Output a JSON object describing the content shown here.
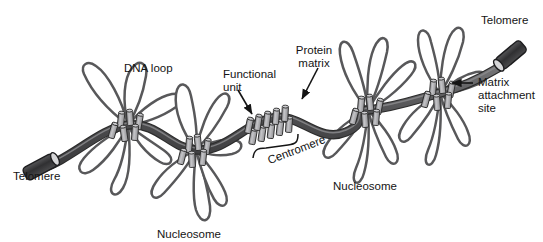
{
  "figure": {
    "background_color": "#ffffff"
  },
  "palette": {
    "strand_fill": "#58585a",
    "strand_stroke": "#2b2b2b",
    "loop_stroke": "#58585a",
    "loop_fill": "#ffffff",
    "cylinder_fill": "#a9a9ac",
    "cylinder_top": "#c9c9cc",
    "cylinder_stroke": "#2b2b2b",
    "telomere_fill": "#3a3a3c",
    "telomere_cap": "#d6d6d8",
    "text_color": "#141414",
    "arrow_color": "#141414"
  },
  "labels": [
    {
      "id": "telomere-left",
      "name": "Telomere",
      "text": "Telomere",
      "lines": [
        "Telomere"
      ],
      "x": 13,
      "y": 170,
      "align": "left",
      "leader": "none",
      "rotation": 0
    },
    {
      "id": "dna-loop",
      "name": "DNA loop",
      "text": "DNA loop",
      "lines": [
        "DNA loop"
      ],
      "x": 124,
      "y": 62,
      "align": "left",
      "leader": "none",
      "rotation": 0
    },
    {
      "id": "functional-unit",
      "name": "Functional unit",
      "text": "Functional unit",
      "lines": [
        "Functional",
        "unit"
      ],
      "x": 223,
      "y": 68,
      "align": "left",
      "leader": "arrow",
      "rotation": 0
    },
    {
      "id": "protein-matrix",
      "name": "Protein matrix",
      "text": "Protein matrix",
      "lines": [
        "Protein",
        "matrix"
      ],
      "x": 281,
      "y": 44,
      "align": "center",
      "leader": "arrow",
      "rotation": 0
    },
    {
      "id": "centromere",
      "name": "Centromere",
      "text": "Centromere",
      "lines": [
        "Centromere"
      ],
      "x": 266,
      "y": 155,
      "align": "left",
      "leader": "bracket",
      "rotation": -21
    },
    {
      "id": "nucleosome-lower",
      "name": "Nucleosome",
      "text": "Nucleosome",
      "lines": [
        "Nucleosome"
      ],
      "x": 157,
      "y": 228,
      "align": "left",
      "leader": "none",
      "rotation": 0
    },
    {
      "id": "nucleosome-right",
      "name": "Nucleosome",
      "text": "Nucleosome",
      "lines": [
        "Nucleosome"
      ],
      "x": 333,
      "y": 180,
      "align": "left",
      "leader": "none",
      "rotation": 0
    },
    {
      "id": "matrix-attachment-site",
      "name": "Matrix attachment site",
      "text": "Matrix attachment site",
      "lines": [
        "Matrix",
        "attachment",
        "site"
      ],
      "x": 478,
      "y": 76,
      "align": "left",
      "leader": "arrow",
      "rotation": 0
    },
    {
      "id": "telomere-right",
      "name": "Telomere",
      "text": "Telomere",
      "lines": [
        "Telomere"
      ],
      "x": 481,
      "y": 14,
      "align": "left",
      "leader": "none",
      "rotation": 0
    }
  ],
  "structures": {
    "scaffold": {
      "name": "protein-matrix-scaffold",
      "description": "wavy dark gray band running left to right"
    },
    "telomeres": [
      {
        "name": "telomere-cap-left",
        "position": "lower-left-end-of-scaffold"
      },
      {
        "name": "telomere-cap-right",
        "position": "upper-right-end-of-scaffold"
      }
    ],
    "rosettes": [
      {
        "name": "loop-rosette-1",
        "loop_count": 6,
        "nucleosome_cluster": true
      },
      {
        "name": "loop-rosette-2",
        "loop_count": 6,
        "nucleosome_cluster": true
      },
      {
        "name": "loop-rosette-3",
        "loop_count": 6,
        "nucleosome_cluster": true
      },
      {
        "name": "loop-rosette-4",
        "loop_count": 6,
        "nucleosome_cluster": true
      }
    ],
    "centromere_region": {
      "name": "centromere-cylinder-row",
      "cylinder_count": 10
    }
  }
}
